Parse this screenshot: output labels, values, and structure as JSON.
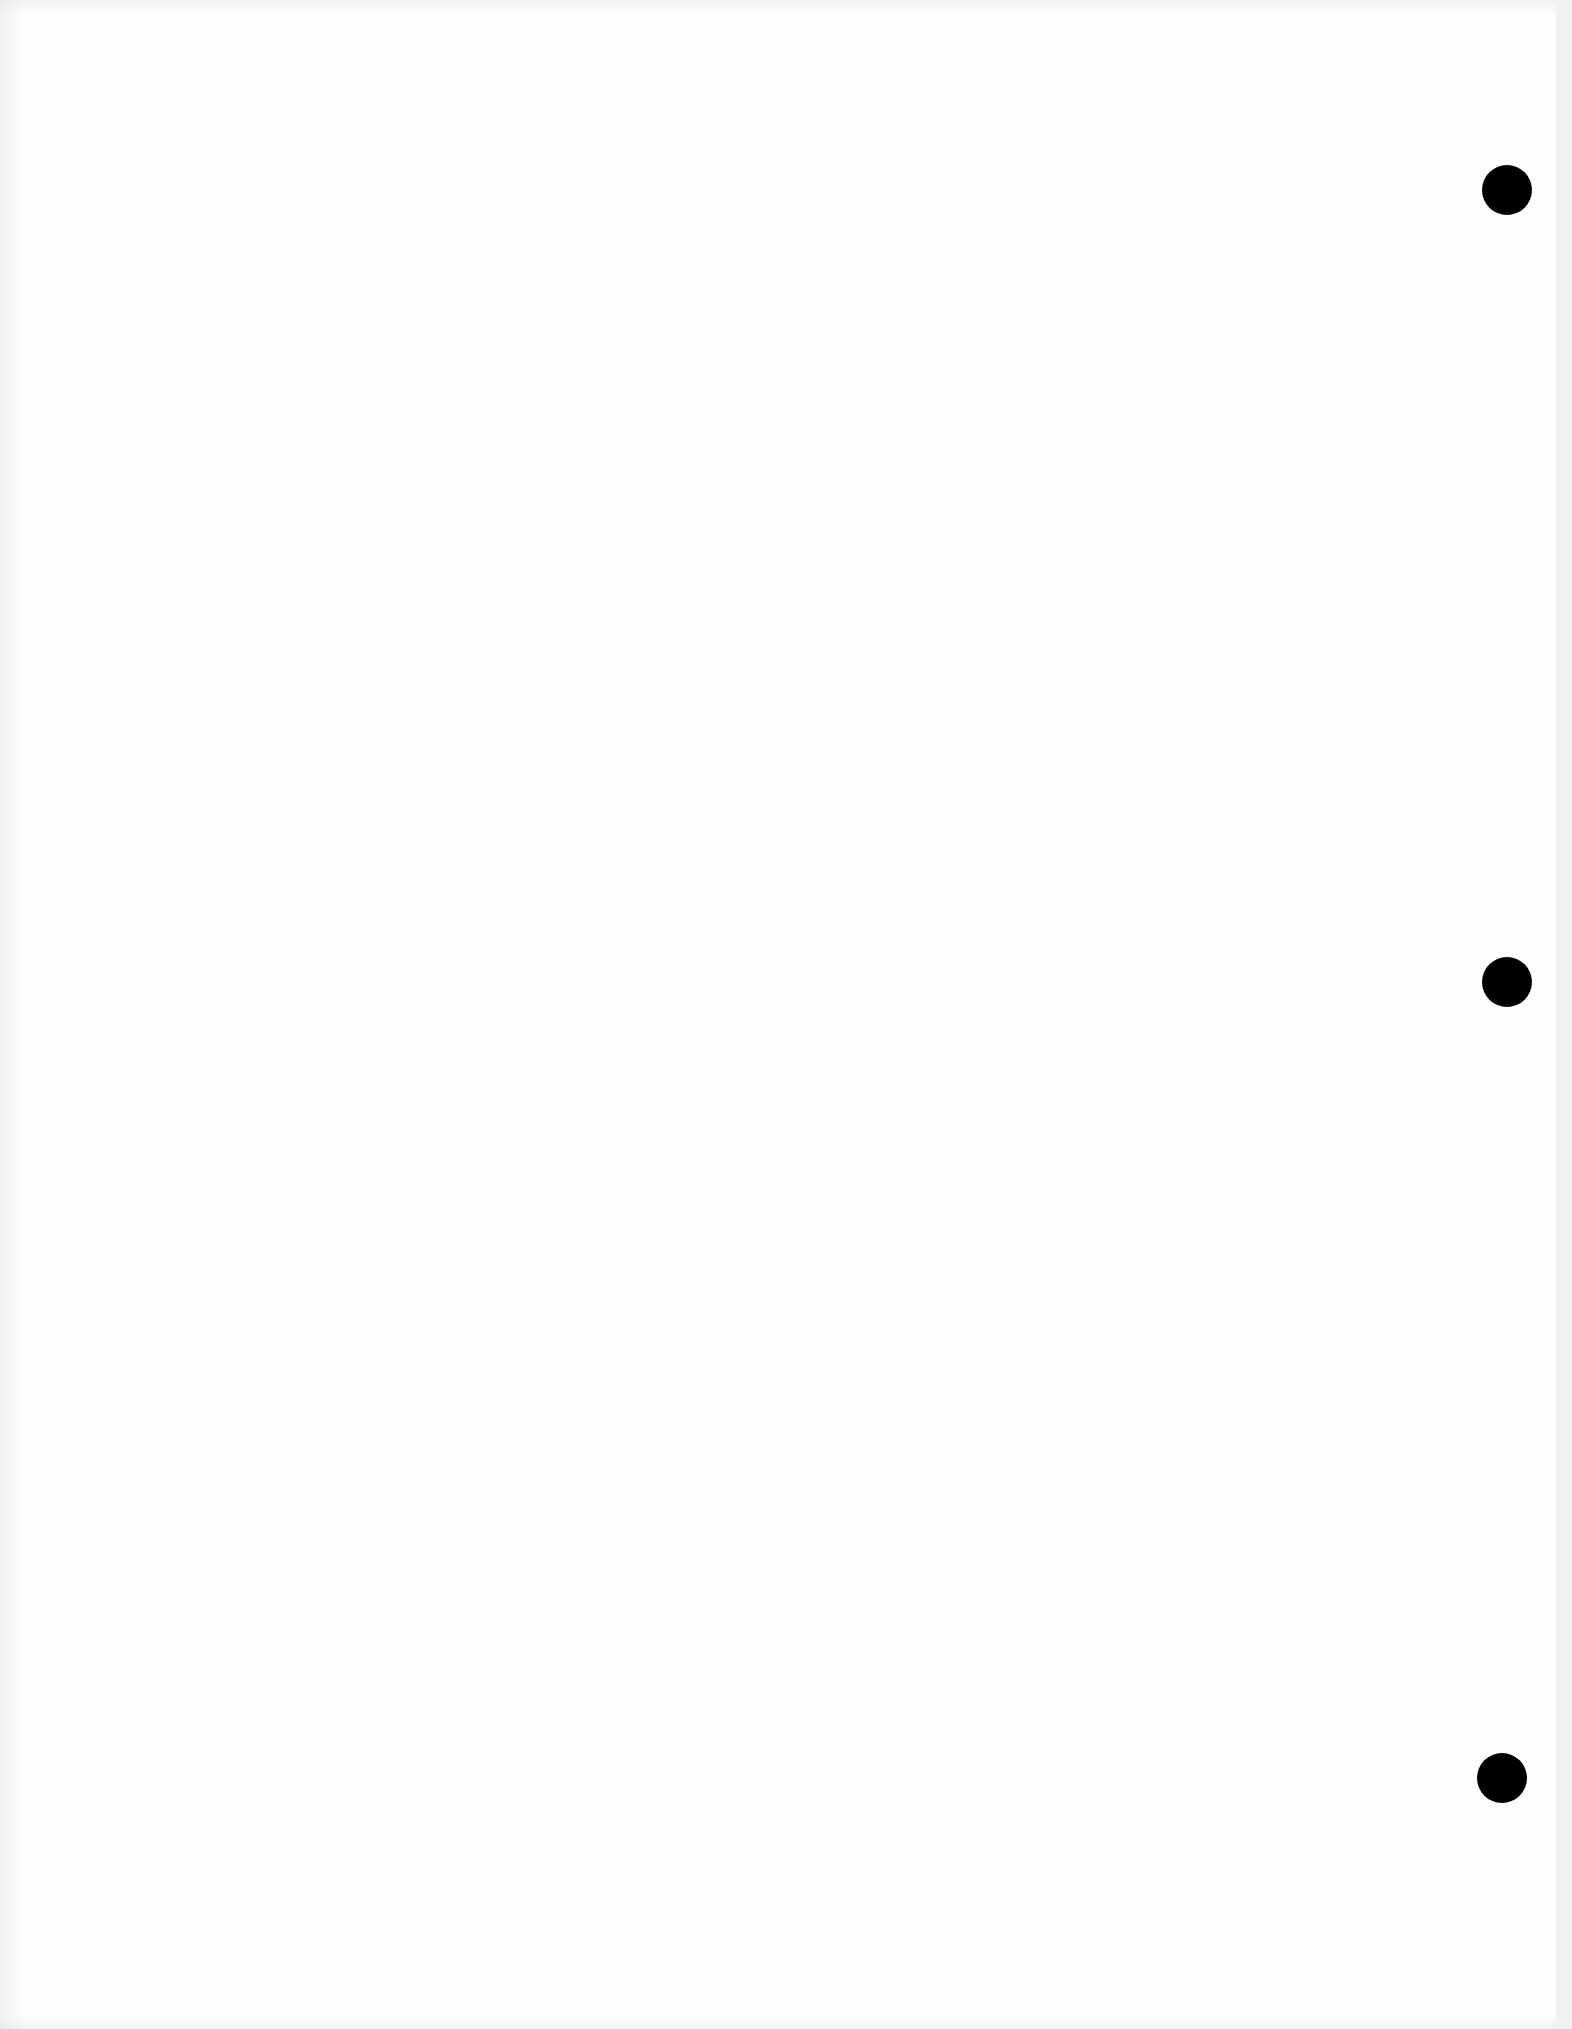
{
  "page": {
    "type": "blank scanned sheet",
    "background_color": "#fdfdfd",
    "visible_text": []
  },
  "punch_holes": [
    {
      "cx": 1507,
      "cy": 190,
      "diameter": 50,
      "color": "#000000"
    },
    {
      "cx": 1507,
      "cy": 982,
      "diameter": 50,
      "color": "#000000"
    },
    {
      "cx": 1502,
      "cy": 1778,
      "diameter": 50,
      "color": "#000000"
    }
  ]
}
